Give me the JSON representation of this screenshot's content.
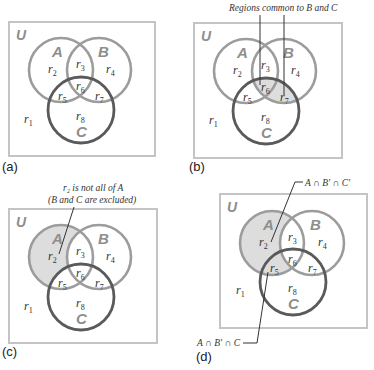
{
  "figure": {
    "universe_label": "U",
    "set_labels": {
      "A": "A",
      "B": "B",
      "C": "C"
    },
    "regions": [
      "r",
      "r",
      "r",
      "r",
      "r",
      "r",
      "r",
      "r"
    ],
    "region_subscripts": [
      "1",
      "2",
      "3",
      "4",
      "5",
      "6",
      "7",
      "8"
    ],
    "colors": {
      "box": "#c4c4c4",
      "circle_A": "#9c9c9c",
      "circle_B": "#9c9c9c",
      "circle_C": "#5a5a5a",
      "shade": "#dddddd",
      "set_label": "#8e8e8e"
    }
  },
  "panels": [
    {
      "id": "a",
      "label": "(a)",
      "shaded_regions": []
    },
    {
      "id": "b",
      "label": "(b)",
      "shaded_regions": [
        "r6",
        "r7"
      ],
      "callout": "Regions common to B and C"
    },
    {
      "id": "c",
      "label": "(c)",
      "shaded_regions": [
        "r2"
      ],
      "callout_line1": "r₂ is not all of A",
      "callout_line2": "(B and C are excluded)"
    },
    {
      "id": "d",
      "label": "(d)",
      "shaded_regions": [
        "r2",
        "r5"
      ],
      "callout_top": "A ∩ B′ ∩ C′",
      "callout_bottom": "A ∩ B′ ∩ C"
    }
  ]
}
